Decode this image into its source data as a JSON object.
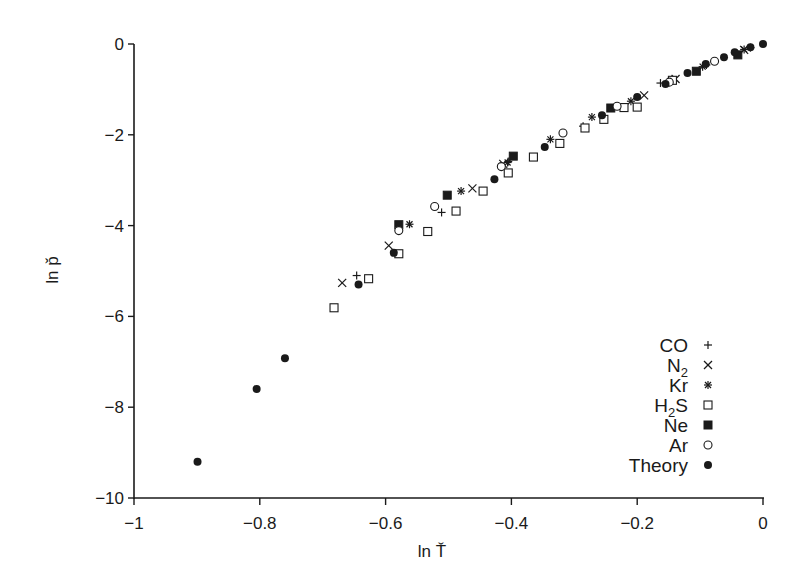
{
  "chart_data": {
    "type": "scatter",
    "title": "",
    "xlabel": "ln Ť",
    "ylabel": "ln p̌",
    "xlim": [
      -1,
      0
    ],
    "ylim": [
      -10,
      0
    ],
    "xticks": [
      -1,
      -0.8,
      -0.6,
      -0.4,
      -0.2,
      0
    ],
    "xtick_labels": [
      "−1",
      "−0.8",
      "−0.6",
      "−0.4",
      "−0.2",
      "0"
    ],
    "yticks": [
      0,
      -2,
      -4,
      -6,
      -8,
      -10
    ],
    "ytick_labels": [
      "0",
      "−2",
      "−4",
      "−6",
      "−8",
      "−10"
    ],
    "grid": false,
    "legend_position": "lower right",
    "series": [
      {
        "name": "CO",
        "label_main": "CO",
        "label_sub": "",
        "label_tail": "",
        "marker": "plus",
        "points": [
          [
            -0.646,
            -5.1
          ],
          [
            -0.511,
            -3.71
          ],
          [
            -0.405,
            -2.59
          ],
          [
            -0.286,
            -1.81
          ],
          [
            -0.163,
            -0.86
          ],
          [
            -0.09,
            -0.46
          ],
          [
            -0.02,
            -0.08
          ]
        ]
      },
      {
        "name": "N2",
        "label_main": "N",
        "label_sub": "2",
        "label_tail": "",
        "marker": "x",
        "points": [
          [
            -0.669,
            -5.26
          ],
          [
            -0.595,
            -4.44
          ],
          [
            -0.462,
            -3.18
          ],
          [
            -0.413,
            -2.64
          ],
          [
            -0.189,
            -1.13
          ],
          [
            -0.139,
            -0.77
          ],
          [
            -0.03,
            -0.13
          ]
        ]
      },
      {
        "name": "Kr",
        "label_main": "Kr",
        "label_sub": "",
        "label_tail": "",
        "marker": "asterisk",
        "points": [
          [
            -0.562,
            -3.97
          ],
          [
            -0.48,
            -3.24
          ],
          [
            -0.406,
            -2.61
          ],
          [
            -0.338,
            -2.1
          ],
          [
            -0.272,
            -1.61
          ],
          [
            -0.21,
            -1.26
          ],
          [
            -0.096,
            -0.5
          ],
          [
            -0.03,
            -0.12
          ]
        ]
      },
      {
        "name": "H2S",
        "label_main": "H",
        "label_sub": "2",
        "label_tail": "S",
        "marker": "open-square",
        "points": [
          [
            -0.682,
            -5.81
          ],
          [
            -0.627,
            -5.17
          ],
          [
            -0.579,
            -4.62
          ],
          [
            -0.533,
            -4.13
          ],
          [
            -0.488,
            -3.68
          ],
          [
            -0.445,
            -3.24
          ],
          [
            -0.405,
            -2.84
          ],
          [
            -0.365,
            -2.49
          ],
          [
            -0.323,
            -2.19
          ],
          [
            -0.283,
            -1.85
          ],
          [
            -0.253,
            -1.66
          ],
          [
            -0.221,
            -1.4
          ],
          [
            -0.2,
            -1.39
          ],
          [
            -0.144,
            -0.8
          ]
        ]
      },
      {
        "name": "Ne",
        "label_main": "Ne",
        "label_sub": "",
        "label_tail": "",
        "marker": "filled-square",
        "points": [
          [
            -0.579,
            -3.98
          ],
          [
            -0.502,
            -3.33
          ],
          [
            -0.397,
            -2.47
          ],
          [
            -0.242,
            -1.41
          ],
          [
            -0.106,
            -0.6
          ],
          [
            -0.04,
            -0.24
          ]
        ]
      },
      {
        "name": "Ar",
        "label_main": "Ar",
        "label_sub": "",
        "label_tail": "",
        "marker": "open-circle",
        "points": [
          [
            -0.579,
            -4.11
          ],
          [
            -0.522,
            -3.58
          ],
          [
            -0.416,
            -2.7
          ],
          [
            -0.318,
            -1.96
          ],
          [
            -0.232,
            -1.37
          ],
          [
            -0.149,
            -0.84
          ],
          [
            -0.077,
            -0.38
          ]
        ]
      },
      {
        "name": "Theory",
        "label_main": "Theory",
        "label_sub": "",
        "label_tail": "",
        "marker": "filled-circle",
        "points": [
          [
            -0.899,
            -9.2
          ],
          [
            -0.805,
            -7.6
          ],
          [
            -0.76,
            -6.92
          ],
          [
            -0.643,
            -5.3
          ],
          [
            -0.587,
            -4.6
          ],
          [
            -0.427,
            -2.98
          ],
          [
            -0.347,
            -2.27
          ],
          [
            -0.256,
            -1.57
          ],
          [
            -0.2,
            -1.17
          ],
          [
            -0.155,
            -0.88
          ],
          [
            -0.12,
            -0.64
          ],
          [
            -0.091,
            -0.44
          ],
          [
            -0.062,
            -0.29
          ],
          [
            -0.045,
            -0.18
          ],
          [
            -0.02,
            -0.07
          ],
          [
            0,
            0
          ]
        ]
      }
    ]
  }
}
